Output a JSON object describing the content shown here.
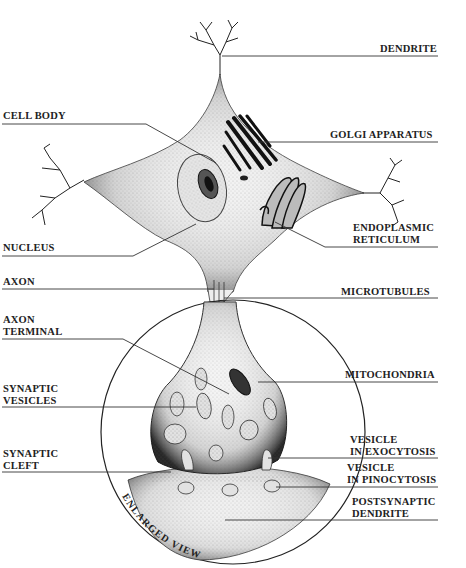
{
  "diagram": {
    "type": "neuron-anatomy",
    "inset_label": "ENLARGED VIEW",
    "labels_left": [
      {
        "id": "cell-body",
        "lines": [
          "CELL BODY"
        ]
      },
      {
        "id": "nucleus",
        "lines": [
          "NUCLEUS"
        ]
      },
      {
        "id": "axon",
        "lines": [
          "AXON"
        ]
      },
      {
        "id": "axon-terminal",
        "lines": [
          "AXON",
          "TERMINAL"
        ]
      },
      {
        "id": "synaptic-vesicles",
        "lines": [
          "SYNAPTIC",
          "VESICLES"
        ]
      },
      {
        "id": "synaptic-cleft",
        "lines": [
          "SYNAPTIC",
          "CLEFT"
        ]
      }
    ],
    "labels_right": [
      {
        "id": "dendrite",
        "lines": [
          "DENDRITE"
        ]
      },
      {
        "id": "golgi-apparatus",
        "lines": [
          "GOLGI APPARATUS"
        ]
      },
      {
        "id": "endoplasmic-reticulum",
        "lines": [
          "ENDOPLASMIC",
          "RETICULUM"
        ]
      },
      {
        "id": "microtubules",
        "lines": [
          "MICROTUBULES"
        ]
      },
      {
        "id": "mitochondria",
        "lines": [
          "MITOCHONDRIA"
        ]
      },
      {
        "id": "vesicle-exocytosis",
        "lines": [
          "VESICLE",
          "IN EXOCYTOSIS"
        ]
      },
      {
        "id": "vesicle-pinocytosis",
        "lines": [
          "VESICLE",
          "IN PINOCYTOSIS"
        ]
      },
      {
        "id": "postsynaptic-dendrite",
        "lines": [
          "POSTSYNAPTIC",
          "DENDRITE"
        ]
      }
    ],
    "colors": {
      "ink": "#1a1a1a",
      "background": "#ffffff",
      "stipple": "#555555"
    }
  }
}
